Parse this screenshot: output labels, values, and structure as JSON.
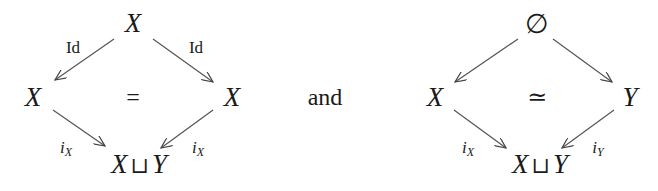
{
  "connector": "and",
  "diagrams": [
    {
      "top": "X",
      "left": "X",
      "right": "X",
      "bottom": {
        "a": "X",
        "op": "⊔",
        "b": "Y"
      },
      "center": "=",
      "arrows": {
        "top_left": "Id",
        "top_right": "Id",
        "left_bottom": {
          "base": "i",
          "sub": "X"
        },
        "right_bottom": {
          "base": "i",
          "sub": "X"
        }
      }
    },
    {
      "top": "∅",
      "left": "X",
      "right": "Y",
      "bottom": {
        "a": "X",
        "op": "⊔",
        "b": "Y"
      },
      "center": "≃",
      "arrows": {
        "left_bottom": {
          "base": "i",
          "sub": "X"
        },
        "right_bottom": {
          "base": "i",
          "sub": "Y"
        }
      }
    }
  ]
}
